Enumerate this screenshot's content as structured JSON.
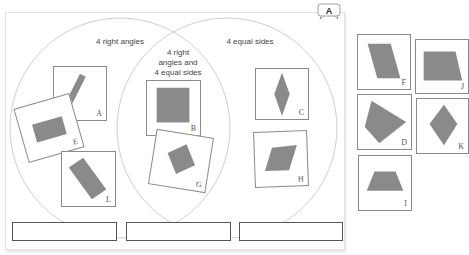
{
  "badge": {
    "label": "A"
  },
  "venn": {
    "left_label": "4 right angles",
    "right_label": "4 equal sides",
    "middle_label_line1": "4 right",
    "middle_label_line2": "angles and",
    "middle_label_line3": "4 equal sides"
  },
  "cards": {
    "A": "A",
    "B": "B",
    "C": "C",
    "D": "D",
    "E": "E",
    "F": "F",
    "G": "G",
    "H": "H",
    "I": "I",
    "J": "J",
    "K": "K",
    "L": "L"
  },
  "answers": [
    "",
    "",
    ""
  ],
  "colors": {
    "shape_fill": "#8a8a8a",
    "circle_stroke": "#cfcfcf",
    "card_border": "#8a8a8a"
  }
}
